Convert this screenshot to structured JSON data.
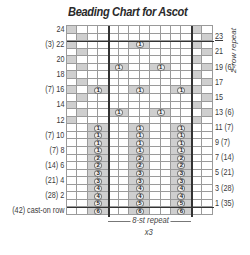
{
  "title": "Beading Chart for Ascot",
  "grid": {
    "columns": 14,
    "rows": 25,
    "cell_w": 10.4,
    "cell_h": 7.56,
    "gray_color": "#cfcfcf",
    "line_color": "#9a9a9a"
  },
  "rows": [
    {
      "row": "24",
      "left_label": "24",
      "right_label": "",
      "gray_cols": [
        1,
        13
      ],
      "beads": []
    },
    {
      "row": "23",
      "left_label": "",
      "right_label": "23",
      "gray_cols": [
        2,
        14
      ],
      "beads": []
    },
    {
      "row": "22",
      "left_label": "(3) 22",
      "right_label": "",
      "gray_cols": [
        1,
        13
      ],
      "beads": [
        {
          "line": 7,
          "n": "1"
        }
      ]
    },
    {
      "row": "21",
      "left_label": "",
      "right_label": "21",
      "gray_cols": [
        2,
        14
      ],
      "beads": []
    },
    {
      "row": "20",
      "left_label": "20",
      "right_label": "",
      "gray_cols": [
        1,
        13
      ],
      "beads": []
    },
    {
      "row": "19",
      "left_label": "",
      "right_label": "19 (6)",
      "gray_cols": [
        2,
        14
      ],
      "beads": [
        {
          "line": 5,
          "n": "1"
        },
        {
          "line": 9,
          "n": "1"
        }
      ]
    },
    {
      "row": "18",
      "left_label": "18",
      "right_label": "",
      "gray_cols": [
        1,
        13
      ],
      "beads": []
    },
    {
      "row": "17",
      "left_label": "",
      "right_label": "17",
      "gray_cols": [
        2,
        14
      ],
      "beads": []
    },
    {
      "row": "16",
      "left_label": "(7) 16",
      "right_label": "",
      "gray_cols": [
        1,
        13
      ],
      "beads": [
        {
          "line": 3,
          "n": "1"
        },
        {
          "line": 7,
          "n": "1"
        },
        {
          "line": 11,
          "n": "1"
        }
      ]
    },
    {
      "row": "15",
      "left_label": "",
      "right_label": "15",
      "gray_cols": [
        2,
        14
      ],
      "beads": []
    },
    {
      "row": "14",
      "left_label": "14",
      "right_label": "",
      "gray_cols": [
        1,
        13
      ],
      "beads": []
    },
    {
      "row": "13",
      "left_label": "",
      "right_label": "13 (6)",
      "gray_cols": [
        2,
        14
      ],
      "beads": [
        {
          "line": 5,
          "n": "1"
        },
        {
          "line": 9,
          "n": "1"
        }
      ]
    },
    {
      "row": "12",
      "left_label": "12",
      "right_label": "",
      "gray_cols": [
        1,
        13
      ],
      "beads": []
    },
    {
      "row": "11",
      "left_label": "",
      "right_label": "11 (7)",
      "gray_cols": [],
      "beads": [
        {
          "line": 3,
          "n": "1"
        },
        {
          "line": 7,
          "n": "1"
        },
        {
          "line": 11,
          "n": "1"
        }
      ]
    },
    {
      "row": "10",
      "left_label": "(7) 10",
      "right_label": "",
      "gray_cols": [],
      "beads": [
        {
          "line": 3,
          "n": "1"
        },
        {
          "line": 7,
          "n": "1"
        },
        {
          "line": 11,
          "n": "1"
        }
      ]
    },
    {
      "row": "9",
      "left_label": "",
      "right_label": "9 (7)",
      "gray_cols": [],
      "beads": [
        {
          "line": 3,
          "n": "1"
        },
        {
          "line": 7,
          "n": "1"
        },
        {
          "line": 11,
          "n": "1"
        }
      ]
    },
    {
      "row": "8",
      "left_label": "(7) 8",
      "right_label": "",
      "gray_cols": [],
      "beads": [
        {
          "line": 3,
          "n": "1"
        },
        {
          "line": 7,
          "n": "1"
        },
        {
          "line": 11,
          "n": "1"
        }
      ]
    },
    {
      "row": "7",
      "left_label": "",
      "right_label": "7 (14)",
      "gray_cols": [],
      "beads": [
        {
          "line": 3,
          "n": "2"
        },
        {
          "line": 7,
          "n": "2"
        },
        {
          "line": 11,
          "n": "2"
        }
      ]
    },
    {
      "row": "6",
      "left_label": "(14) 6",
      "right_label": "",
      "gray_cols": [],
      "beads": [
        {
          "line": 3,
          "n": "2"
        },
        {
          "line": 7,
          "n": "2"
        },
        {
          "line": 11,
          "n": "2"
        }
      ]
    },
    {
      "row": "5",
      "left_label": "",
      "right_label": "5 (21)",
      "gray_cols": [],
      "beads": [
        {
          "line": 3,
          "n": "3"
        },
        {
          "line": 7,
          "n": "3"
        },
        {
          "line": 11,
          "n": "3"
        }
      ]
    },
    {
      "row": "4",
      "left_label": "(21) 4",
      "right_label": "",
      "gray_cols": [],
      "beads": [
        {
          "line": 3,
          "n": "3"
        },
        {
          "line": 7,
          "n": "3"
        },
        {
          "line": 11,
          "n": "3"
        }
      ]
    },
    {
      "row": "3",
      "left_label": "",
      "right_label": "3 (28)",
      "gray_cols": [],
      "beads": [
        {
          "line": 3,
          "n": "4"
        },
        {
          "line": 7,
          "n": "4"
        },
        {
          "line": 11,
          "n": "4"
        }
      ]
    },
    {
      "row": "2",
      "left_label": "(28) 2",
      "right_label": "",
      "gray_cols": [],
      "beads": [
        {
          "line": 3,
          "n": "4"
        },
        {
          "line": 7,
          "n": "4"
        },
        {
          "line": 11,
          "n": "4"
        }
      ]
    },
    {
      "row": "1",
      "left_label": "",
      "right_label": "1 (35)",
      "gray_cols": [],
      "beads": [
        {
          "line": 3,
          "n": "5"
        },
        {
          "line": 7,
          "n": "5"
        },
        {
          "line": 11,
          "n": "5"
        }
      ]
    },
    {
      "row": "cast-on",
      "left_label": "(42) cast-on row",
      "right_label": "",
      "gray_cols": [],
      "beads": [
        {
          "line": 3,
          "n": "6"
        },
        {
          "line": 7,
          "n": "6"
        },
        {
          "line": 11,
          "n": "6"
        }
      ]
    }
  ],
  "repeat": {
    "stitch_label": "8-st repeat",
    "times_label": "x3",
    "start_col": 5,
    "end_col": 12
  },
  "row_repeat": {
    "label": "2-row repeat"
  }
}
